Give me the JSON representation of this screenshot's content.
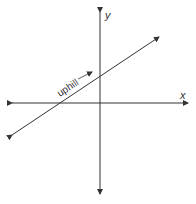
{
  "diagram": {
    "x_axis_label": "x",
    "y_axis_label": "y",
    "annotation": "uphill",
    "line_color": "#333333"
  }
}
